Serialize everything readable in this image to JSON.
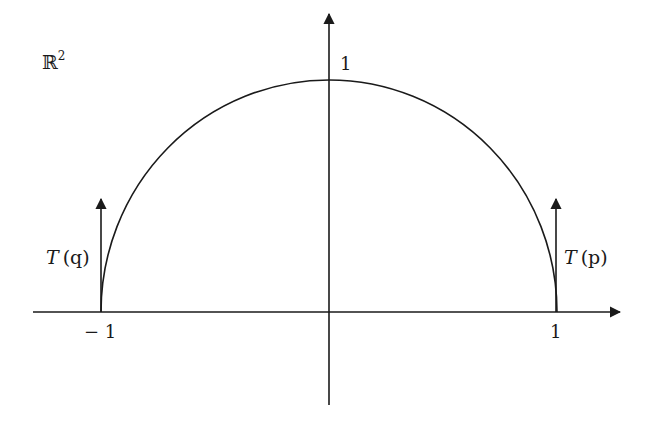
{
  "space_label": "ℝ",
  "space_exponent": "2",
  "y_tick_label": "1",
  "x_tick_neg_label": "− 1",
  "x_tick_pos_label": "1",
  "vector_left": {
    "name": "T",
    "arg": "(q)"
  },
  "vector_right": {
    "name": "T",
    "arg": "(p)"
  },
  "colors": {
    "ink": "#1a1a1a",
    "background": "#ffffff"
  }
}
